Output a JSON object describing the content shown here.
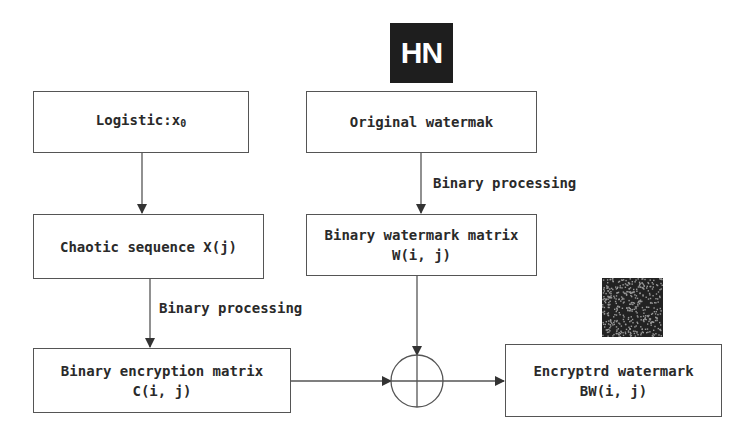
{
  "diagram": {
    "nodes": {
      "logistic": {
        "label": "Logistic:x",
        "subscript": "0"
      },
      "original_watermark": {
        "label": "Original watermak"
      },
      "chaotic_sequence": {
        "label": "Chaotic sequence X(j)"
      },
      "binary_watermark_matrix": {
        "line1": "Binary watermark matrix",
        "line2": "W(i, j)"
      },
      "binary_encryption_matrix": {
        "line1": "Binary encryption matrix",
        "line2": "C(i, j)"
      },
      "encrypted_watermark": {
        "line1": "Encryptrd watermark",
        "line2": "BW(i, j)"
      }
    },
    "edge_labels": {
      "left": "Binary processing",
      "right": "Binary processing"
    },
    "images": {
      "original_watermark_image": "HN",
      "encrypted_watermark_image": "noise-pattern"
    },
    "operator": "xor-circle-plus",
    "colors": {
      "line": "#555555",
      "text": "#2a2a2a",
      "image_dark": "#1e1e1e"
    }
  }
}
